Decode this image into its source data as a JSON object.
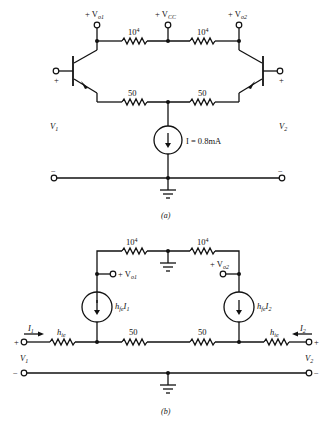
{
  "figure_a": {
    "caption": "(a)",
    "vo1_label": "+ V",
    "vo1_sub": "o1",
    "vcc_label": "+ V",
    "vcc_sub": "CC",
    "vo2_label": "+ V",
    "vo2_sub": "o2",
    "r_collector_left": "10",
    "r_collector_left_exp": "4",
    "r_collector_right": "10",
    "r_collector_right_exp": "4",
    "r_emitter_left": "50",
    "r_emitter_right": "50",
    "current_source_label": "I = 0.8mA",
    "v1_label": "V",
    "v1_sub": "1",
    "v2_label": "V",
    "v2_sub": "2",
    "plus": "+",
    "minus": "−"
  },
  "figure_b": {
    "caption": "(b)",
    "r_top_left": "10",
    "r_top_left_exp": "4",
    "r_top_right": "10",
    "r_top_right_exp": "4",
    "vo1_label": "+ V",
    "vo1_sub": "o1",
    "vo2_label": "+ V",
    "vo2_sub": "o2",
    "src_left_label": "h",
    "src_left_sub": "fe",
    "src_left_var": "I",
    "src_left_var_sub": "1",
    "src_right_label": "h",
    "src_right_sub": "fe",
    "src_right_var": "I",
    "src_right_var_sub": "2",
    "r_hie_left": "h",
    "r_hie_left_sub": "ie",
    "r_hie_right": "h",
    "r_hie_right_sub": "ie",
    "r_mid_left": "50",
    "r_mid_right": "50",
    "i1_label": "I",
    "i1_sub": "1",
    "i2_label": "I",
    "i2_sub": "2",
    "v1_label": "V",
    "v1_sub": "1",
    "v2_label": "V",
    "v2_sub": "2",
    "plus": "+",
    "minus": "−"
  }
}
